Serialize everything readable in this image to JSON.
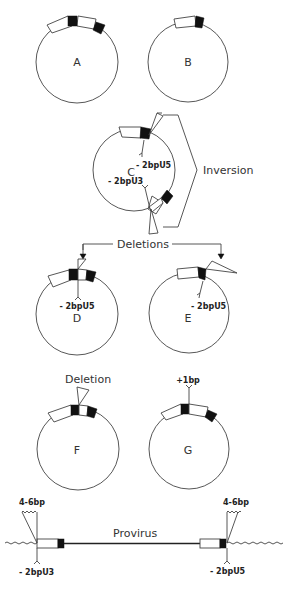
{
  "figure": {
    "circles": [
      {
        "id": "A",
        "label": "A"
      },
      {
        "id": "B",
        "label": "B"
      },
      {
        "id": "C",
        "label": "C",
        "annotations": [
          "- 2bpU5",
          "- 2bpU3"
        ]
      },
      {
        "id": "D",
        "label": "D",
        "annotations": [
          "- 2bpU5"
        ]
      },
      {
        "id": "E",
        "label": "E",
        "annotations": [
          "- 2bpU5"
        ]
      },
      {
        "id": "F",
        "label": "F",
        "annotations": [
          "Deletion"
        ]
      },
      {
        "id": "G",
        "label": "G",
        "annotations": [
          "+1bp"
        ]
      }
    ],
    "brackets": {
      "inversion": "Inversion",
      "deletions": "Deletions"
    },
    "provirus": {
      "label": "Provirus",
      "left_top": "4-6bp",
      "right_top": "4-6bp",
      "left_bottom": "- 2bpU3",
      "right_bottom": "- 2bpU5"
    }
  }
}
